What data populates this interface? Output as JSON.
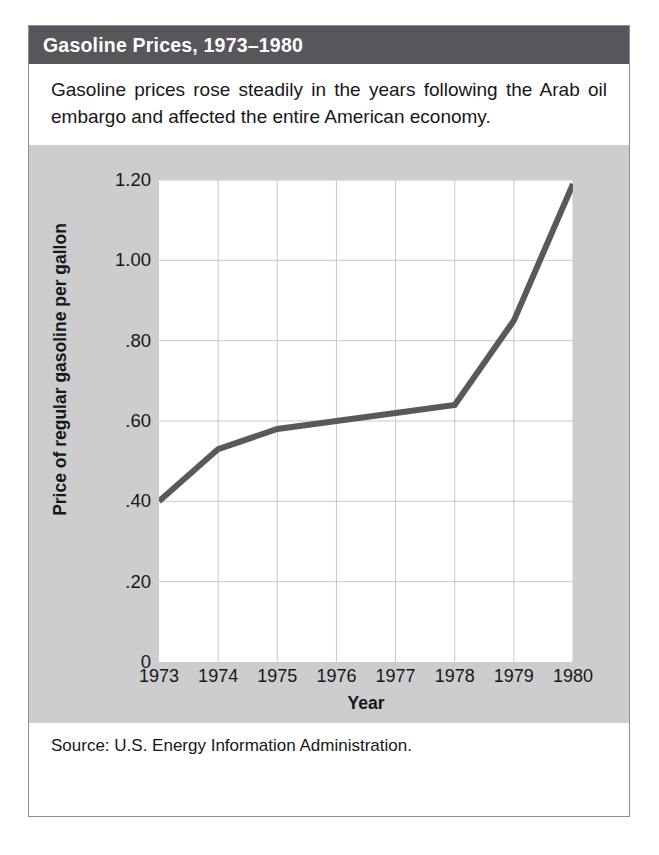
{
  "figure": {
    "title": "Gasoline Prices, 1973–1980",
    "caption": "Gasoline prices rose steadily in the years following the Arab oil embargo and affected the entire American economy.",
    "source": "Source: U.S. Energy Information Administration.",
    "colors": {
      "title_band": "#57565a",
      "panel_background": "#cdcdcd",
      "plot_background": "#ffffff",
      "line": "#595959",
      "gridline": "#c8c8c8",
      "text": "#17171a"
    }
  },
  "chart_data": {
    "type": "line",
    "title": "Gasoline Prices, 1973–1980",
    "subtitle": "",
    "xlabel": "Year",
    "ylabel": "Price of regular gasoline per gallon",
    "x": [
      1973,
      1974,
      1975,
      1976,
      1977,
      1978,
      1979,
      1980
    ],
    "categories": [
      "1973",
      "1974",
      "1975",
      "1976",
      "1977",
      "1978",
      "1979",
      "1980"
    ],
    "values": [
      0.4,
      0.53,
      0.58,
      0.6,
      0.62,
      0.64,
      0.85,
      1.19
    ],
    "xtick_labels": [
      "1973",
      "1974",
      "1975",
      "1976",
      "1977",
      "1978",
      "1979",
      "1980"
    ],
    "ytick_labels": [
      "0",
      ".20",
      ".40",
      ".60",
      ".80",
      "1.00",
      "1.20"
    ],
    "ytick_values": [
      0,
      0.2,
      0.4,
      0.6,
      0.8,
      1.0,
      1.2
    ],
    "xlim": [
      1973,
      1980
    ],
    "ylim": [
      0,
      1.2
    ],
    "grid": true,
    "legend": false,
    "legend_position": "none",
    "annotations": []
  }
}
